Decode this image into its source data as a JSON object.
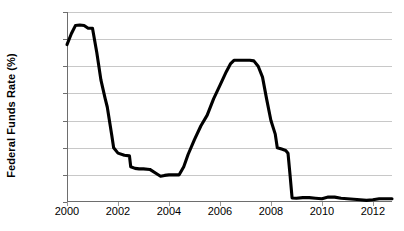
{
  "chart_data": {
    "type": "line",
    "title": "",
    "xlabel": "",
    "ylabel": "Federal Funds Rate (%)",
    "ylim": [
      0,
      7
    ],
    "xlim": [
      2000,
      2012.75
    ],
    "yticks": [
      0,
      1,
      2,
      3,
      4,
      5,
      6,
      7
    ],
    "ytick_labels": [
      "0",
      "1",
      "2",
      "3",
      "4",
      "5",
      "6",
      "7"
    ],
    "xticks": [
      2000,
      2002,
      2004,
      2006,
      2008,
      2010,
      2012
    ],
    "xtick_labels": [
      "2000",
      "2002",
      "2004",
      "2006",
      "2008",
      "2010",
      "2012"
    ],
    "grid": "horizontal",
    "legend": "none",
    "line_color": "#000000",
    "gridline_color": "#c8c8c8",
    "axis_color": "#6e6e6e",
    "background_color": "#ffffff",
    "series": [
      {
        "name": "Federal Funds Rate",
        "x": [
          2000.0,
          2000.17,
          2000.33,
          2000.5,
          2000.67,
          2000.83,
          2001.0,
          2001.17,
          2001.33,
          2001.5,
          2001.58,
          2001.75,
          2001.83,
          2002.0,
          2002.25,
          2002.45,
          2002.5,
          2002.67,
          2002.83,
          2003.0,
          2003.25,
          2003.5,
          2003.67,
          2003.83,
          2004.0,
          2004.25,
          2004.4,
          2004.58,
          2004.75,
          2005.0,
          2005.25,
          2005.5,
          2005.75,
          2006.0,
          2006.25,
          2006.42,
          2006.55,
          2006.75,
          2007.0,
          2007.17,
          2007.33,
          2007.5,
          2007.67,
          2007.83,
          2008.0,
          2008.17,
          2008.25,
          2008.42,
          2008.58,
          2008.67,
          2008.75,
          2008.83,
          2009.0,
          2009.25,
          2009.5,
          2009.75,
          2010.0,
          2010.25,
          2010.5,
          2010.75,
          2011.0,
          2011.25,
          2011.5,
          2011.75,
          2012.0,
          2012.25,
          2012.5,
          2012.75
        ],
        "y": [
          5.8,
          6.2,
          6.5,
          6.52,
          6.5,
          6.4,
          6.4,
          5.5,
          4.5,
          3.8,
          3.5,
          2.5,
          2.0,
          1.8,
          1.72,
          1.7,
          1.3,
          1.24,
          1.22,
          1.22,
          1.2,
          1.05,
          0.95,
          0.98,
          1.0,
          1.0,
          1.0,
          1.3,
          1.75,
          2.3,
          2.8,
          3.2,
          3.8,
          4.3,
          4.8,
          5.1,
          5.22,
          5.22,
          5.22,
          5.22,
          5.2,
          5.0,
          4.6,
          3.8,
          3.0,
          2.5,
          2.0,
          1.95,
          1.9,
          1.8,
          1.0,
          0.15,
          0.14,
          0.16,
          0.16,
          0.14,
          0.12,
          0.18,
          0.18,
          0.14,
          0.12,
          0.1,
          0.08,
          0.06,
          0.08,
          0.12,
          0.12,
          0.12
        ]
      }
    ]
  }
}
